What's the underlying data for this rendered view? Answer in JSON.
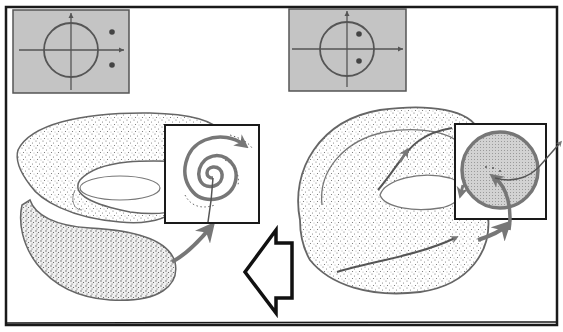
{
  "figure": {
    "title": "",
    "colors": {
      "frame": "#1a1a1a",
      "panel_fill": "#c4c4c4",
      "panel_border": "#555555",
      "curve": "#777777",
      "stipple": "#6a6a6a",
      "disk_fill": "#cfcfcf",
      "background": "#ffffff"
    }
  },
  "panels": [
    {
      "id": "left",
      "eigenvalue_plot": {
        "unit_circle": true,
        "points": [
          [
            1.45,
            0.55
          ],
          [
            1.45,
            -0.55
          ]
        ],
        "note": "complex-conjugate pair outside unit circle"
      },
      "inset": "spiral-trajectory",
      "surface": "torus-with-sheet"
    },
    {
      "id": "right",
      "eigenvalue_plot": {
        "unit_circle": true,
        "points": [
          [
            0.45,
            0.55
          ],
          [
            0.45,
            -0.55
          ]
        ],
        "note": "complex-conjugate pair inside unit circle"
      },
      "inset": "invariant-circle-disk",
      "surface": "torus-with-trajectory"
    }
  ],
  "transition_arrow": {
    "direction": "left",
    "style": "hollow"
  }
}
